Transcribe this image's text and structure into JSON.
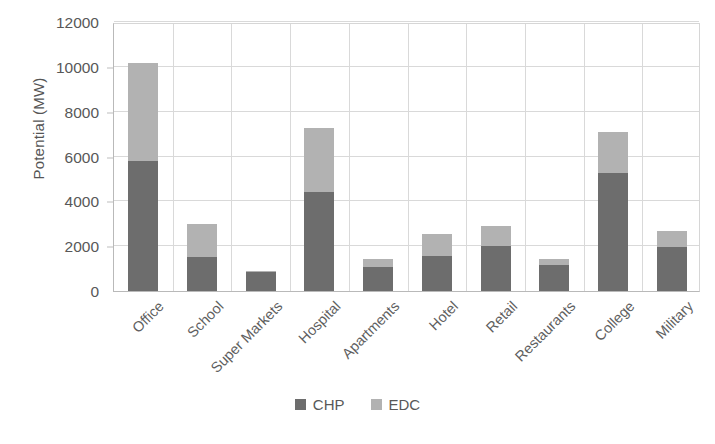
{
  "chart_data": {
    "type": "bar",
    "subtype": "stacked-vertical",
    "title": "",
    "xlabel": "",
    "ylabel": "Potential (MW)",
    "ylim": [
      0,
      12000
    ],
    "ytick_step": 2000,
    "yticks": [
      "12000",
      "10000",
      "8000",
      "6000",
      "4000",
      "2000",
      "0"
    ],
    "ytick_values": [
      12000,
      10000,
      8000,
      6000,
      4000,
      2000,
      0
    ],
    "grid": "horizontal-and-vertical",
    "legend_position": "bottom-center",
    "categories": [
      "Office",
      "School",
      "Super Markets",
      "Hospital",
      "Apartments",
      "Hotel",
      "Retail",
      "Restaurants",
      "College",
      "Military"
    ],
    "series": [
      {
        "name": "CHP",
        "color": "#6d6d6d",
        "values": [
          5800,
          1500,
          850,
          4420,
          1080,
          1570,
          2000,
          1150,
          5250,
          1960
        ]
      },
      {
        "name": "EDC",
        "color": "#b2b2b2",
        "values": [
          4350,
          1500,
          50,
          2850,
          370,
          980,
          890,
          300,
          1840,
          720
        ]
      }
    ],
    "totals": [
      10150,
      3000,
      900,
      7270,
      1450,
      2550,
      2890,
      1450,
      7090,
      2680
    ]
  },
  "legend": {
    "items": [
      {
        "label": "CHP",
        "color": "#6d6d6d"
      },
      {
        "label": "EDC",
        "color": "#b2b2b2"
      }
    ]
  }
}
